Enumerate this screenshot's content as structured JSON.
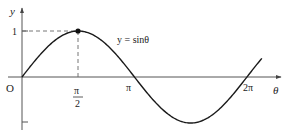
{
  "chart_data": {
    "type": "line",
    "title": "",
    "function_label": "y = sinθ",
    "xlabel": "θ",
    "ylabel": "y",
    "origin_label": "O",
    "x_ticks": [
      {
        "value": 1.5708,
        "label_num": "π",
        "label_den": "2"
      },
      {
        "value": 3.1416,
        "label": "π"
      },
      {
        "value": 6.2832,
        "label": "2π"
      }
    ],
    "y_ticks": [
      {
        "value": 1,
        "label": "1"
      },
      {
        "value": -1,
        "label": ""
      }
    ],
    "xlim": [
      0,
      6.9
    ],
    "ylim": [
      -1.1,
      1.3
    ],
    "series": [
      {
        "name": "sinθ",
        "x": [
          0,
          0.5236,
          1.0472,
          1.5708,
          2.0944,
          2.618,
          3.1416,
          3.6652,
          4.1888,
          4.7124,
          5.236,
          5.7596,
          6.2832,
          6.7
        ],
        "values": [
          0,
          0.5,
          0.866,
          1,
          0.866,
          0.5,
          0,
          -0.5,
          -0.866,
          -1,
          -0.866,
          -0.5,
          0,
          0.404
        ]
      }
    ],
    "highlighted_point": {
      "x": 1.5708,
      "y": 1
    },
    "guides": "dashed lines from (π/2, 1) to both axes",
    "grid": false,
    "legend": "none",
    "colors": {
      "curve": "#1a1a1a",
      "axes": "#555555",
      "dash": "#666666"
    }
  }
}
